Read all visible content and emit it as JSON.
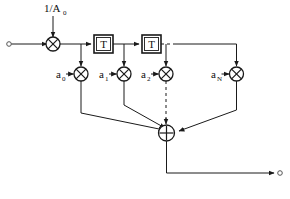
{
  "diagram": {
    "type": "block-diagram",
    "background_color": "#ffffff",
    "line_color": "#1a1a1a",
    "input": {
      "terminal_name": "input-terminal",
      "label": ""
    },
    "output": {
      "terminal_name": "output-terminal",
      "label": ""
    },
    "gain": {
      "label": "1/A",
      "subscript": "0",
      "node_glyph": "multiply-circle"
    },
    "delays": [
      {
        "label": "T"
      },
      {
        "label": "T"
      }
    ],
    "taps": [
      {
        "label": "a",
        "subscript": "0",
        "node_glyph": "multiply-circle"
      },
      {
        "label": "a",
        "subscript": "1",
        "node_glyph": "multiply-circle"
      },
      {
        "label": "a",
        "subscript": "2",
        "node_glyph": "multiply-circle"
      },
      {
        "label": "a",
        "subscript": "N",
        "node_glyph": "multiply-circle"
      }
    ],
    "summer": {
      "label": "",
      "node_glyph": "plus-circle"
    },
    "ellipsis_hint": "dashed continuation between a2 and aN"
  }
}
